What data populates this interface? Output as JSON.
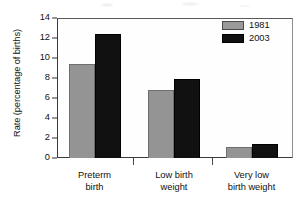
{
  "chart_data": {
    "type": "bar",
    "title": "",
    "xlabel": "",
    "ylabel": "Rate (percentage of births)",
    "categories": [
      "Preterm birth",
      "Low birth weight",
      "Very low birth weight"
    ],
    "category_lines": [
      [
        "Preterm",
        "birth"
      ],
      [
        "Low birth",
        "weight"
      ],
      [
        "Very low",
        "birth weight"
      ]
    ],
    "series": [
      {
        "name": "1981",
        "color": "#949494",
        "values": [
          9.4,
          6.85,
          1.1
        ]
      },
      {
        "name": "2003",
        "color": "#111111",
        "values": [
          12.4,
          7.95,
          1.45
        ]
      }
    ],
    "ylim": [
      0,
      14
    ],
    "yticks": [
      0,
      2,
      4,
      6,
      8,
      10,
      12,
      14
    ],
    "ytick_labels": [
      "0",
      "2",
      "4",
      "6",
      "8",
      "10",
      "12",
      "14"
    ],
    "grid": false,
    "legend_position": "top-right"
  },
  "legend": {
    "items": [
      {
        "label": "1981"
      },
      {
        "label": "2003"
      }
    ]
  },
  "axis": {
    "y_title": "Rate (percentage of births)"
  }
}
